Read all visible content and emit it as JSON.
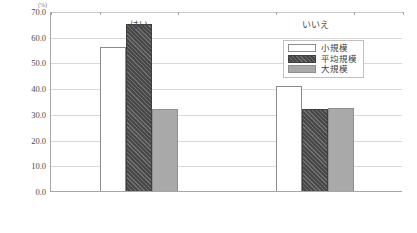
{
  "chart_data": {
    "type": "bar",
    "title": "",
    "subtitle": "",
    "unit_label": "(%)",
    "xlabel": "",
    "ylabel": "",
    "categories": [
      "はい",
      "いいえ"
    ],
    "series": [
      {
        "name": "小規模",
        "values": [
          56.0,
          40.8
        ],
        "color": "#ffffff",
        "pattern": "solid"
      },
      {
        "name": "平均規模",
        "values": [
          65.0,
          32.0
        ],
        "color": "#555555",
        "pattern": "diagonal-hatch"
      },
      {
        "name": "大規模",
        "values": [
          32.0,
          32.2
        ],
        "color": "#a9a9a9",
        "pattern": "solid"
      }
    ],
    "ylim": [
      0.0,
      70.0
    ],
    "yticks": [
      0.0,
      10.0,
      20.0,
      30.0,
      40.0,
      50.0,
      60.0,
      70.0
    ],
    "ytick_labels": [
      "0.0",
      "10.0",
      "20.0",
      "30.0",
      "40.0",
      "50.0",
      "60.0",
      "70.0"
    ],
    "grid": true,
    "grid_axis": "y",
    "legend_position": "top-right",
    "legend_entries": [
      "小規模",
      "平均規模",
      "大規模"
    ]
  }
}
